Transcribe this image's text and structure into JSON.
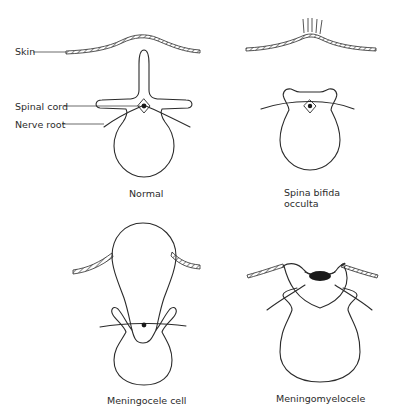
{
  "figure": {
    "panels": [
      {
        "id": "normal",
        "caption": "Normal"
      },
      {
        "id": "spina-bifida-occulta",
        "caption_line1": "Spina bifida",
        "caption_line2": "occulta"
      },
      {
        "id": "meningocele",
        "caption": "Meningocele cell"
      },
      {
        "id": "meningomyelocele",
        "caption": "Meningomyelocele"
      }
    ],
    "labels": {
      "skin": "Skin",
      "spinal_cord": "Spinal cord",
      "nerve_root": "Nerve root"
    },
    "colors": {
      "line": "#2b2b2b",
      "background": "#ffffff"
    }
  }
}
